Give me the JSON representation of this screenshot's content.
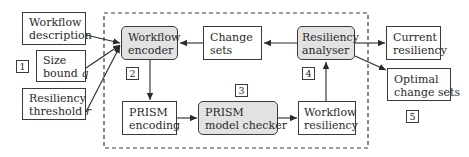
{
  "inputs": {
    "workflow_description": [
      "Workflow",
      "description"
    ],
    "size_bound": [
      "Size",
      "bound",
      "q"
    ],
    "resiliency_threshold": [
      "Resiliency",
      "threshold",
      "r"
    ],
    "tag": "1"
  },
  "process": {
    "workflow_encoder": [
      "Workflow",
      "encoder"
    ],
    "encoder_tag": "2",
    "change_sets": [
      "Change",
      "sets"
    ],
    "resiliency_analyser": [
      "Resiliency",
      "analyser"
    ],
    "analyser_tag": "4",
    "prism_encoding": [
      "PRISM",
      "encoding"
    ],
    "prism_model_checker": [
      "PRISM",
      "model checker"
    ],
    "checker_tag": "3",
    "workflow_resiliency": [
      "Workflow",
      "resiliency"
    ]
  },
  "outputs": {
    "current_resiliency": [
      "Current",
      "resiliency"
    ],
    "optimal_change_sets": [
      "Optimal",
      "change sets"
    ],
    "tag": "5"
  },
  "colors": {
    "stroke": "#3a3a3a",
    "process_fill": "#e2e2e2"
  }
}
